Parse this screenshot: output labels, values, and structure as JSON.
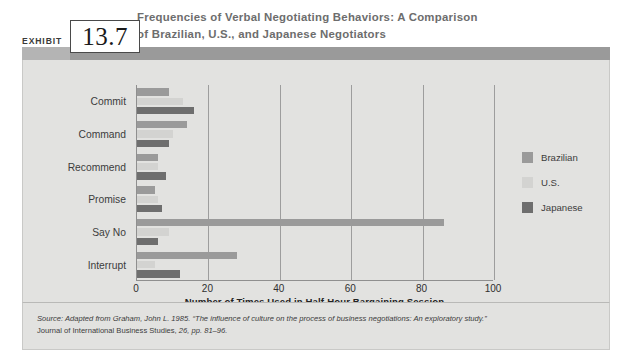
{
  "exhibit": {
    "label": "EXHIBIT",
    "number": "13.7",
    "title_line1": "Frequencies of Verbal Negotiating Behaviors: A Comparison",
    "title_line2": "of Brazilian, U.S., and Japanese Negotiators"
  },
  "source": {
    "line1": "Source: Adapted from Graham, John L. 1985. “The influence of culture on the process of business negotiations: An exploratory study.”",
    "line2_plain": "Journal of International Business Studies,",
    "line2_italic": " 26, pp. 81–96."
  },
  "colors": {
    "brazilian": "#9a9a9a",
    "us": "#d3d3d1",
    "japanese": "#6e6e6e",
    "panel": "#e2e2e0",
    "band": "#9a9a9a",
    "axis": "#8f8f8f",
    "grid": "#9d9d9d"
  },
  "chart_data": {
    "type": "bar",
    "orientation": "horizontal",
    "title": "Frequencies of Verbal Negotiating Behaviors: A Comparison of Brazilian, U.S., and Japanese Negotiators",
    "xlabel": "Number of  Times Used in Half-Hour Bargaining Session",
    "ylabel": "",
    "xlim": [
      0,
      100
    ],
    "xticks": [
      0,
      20,
      40,
      60,
      80,
      100
    ],
    "grid": true,
    "legend_position": "right",
    "categories": [
      "Commit",
      "Command",
      "Recommend",
      "Promise",
      "Say No",
      "Interrupt"
    ],
    "series": [
      {
        "name": "Brazilian",
        "color": "#9a9a9a",
        "values": [
          9,
          14,
          6,
          5,
          86,
          28
        ]
      },
      {
        "name": "U.S.",
        "color": "#d3d3d1",
        "values": [
          13,
          10,
          6,
          6,
          9,
          5
        ]
      },
      {
        "name": "Japanese",
        "color": "#6e6e6e",
        "values": [
          16,
          9,
          8,
          7,
          6,
          12
        ]
      }
    ]
  }
}
